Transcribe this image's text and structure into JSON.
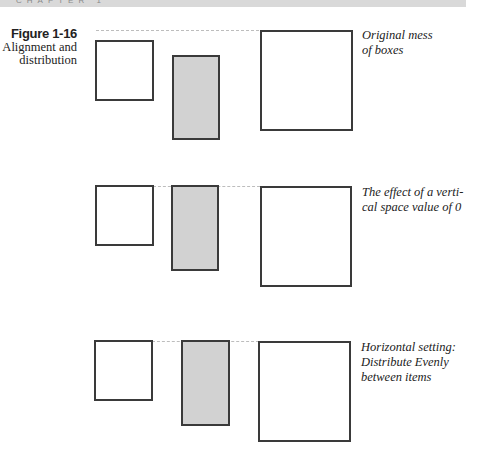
{
  "header": {
    "chapter_label": "CHAPTER 1",
    "bar_color": "#d9d9d9"
  },
  "figure": {
    "number": "Figure 1-16",
    "description_line1": "Alignment and",
    "description_line2": "distribution"
  },
  "colors": {
    "box_border": "#3a3a3a",
    "shaded_fill": "#d2d2d2",
    "guide_dash": "#bdbdbd"
  },
  "examples": [
    {
      "caption_line1": "Original mess",
      "caption_line2": "of boxes",
      "caption_line3": ""
    },
    {
      "caption_line1": "The effect of a verti-",
      "caption_line2": "cal space value of 0",
      "caption_line3": ""
    },
    {
      "caption_line1": "Horizontal setting:",
      "caption_line2": "Distribute Evenly",
      "caption_line3": "between items"
    }
  ]
}
